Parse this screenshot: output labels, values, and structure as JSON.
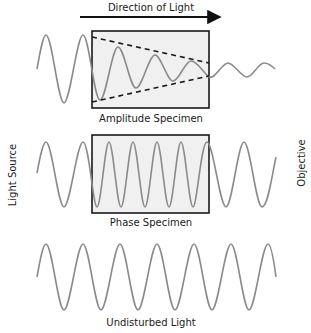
{
  "header": {
    "direction_label": "Direction of Light"
  },
  "side_labels": {
    "left": "Light Source",
    "right": "Objective"
  },
  "panels": [
    {
      "id": "amplitude",
      "label": "Amplitude Specimen"
    },
    {
      "id": "phase",
      "label": "Phase Specimen"
    },
    {
      "id": "undisturbed",
      "label": "Undisturbed Light"
    }
  ],
  "colors": {
    "wave": "#8a8a8a",
    "box_fill": "#f0f0f0",
    "box_stroke": "#1a1a1a",
    "text": "#1a1a1a"
  }
}
